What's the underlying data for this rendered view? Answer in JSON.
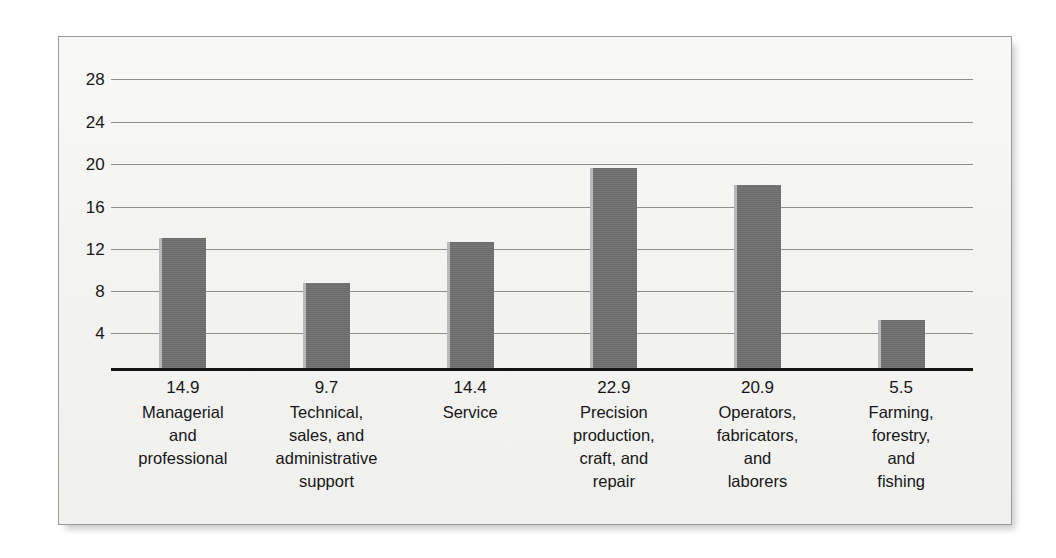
{
  "chart_data": {
    "type": "bar",
    "title": "",
    "subtitle": "",
    "xlabel": "",
    "ylabel": "",
    "ylim": [
      0,
      30
    ],
    "yticks": [
      28,
      24,
      20,
      16,
      12,
      8,
      4
    ],
    "grid": true,
    "legend": false,
    "legend_position": "none",
    "categories": [
      "Managerial\nand\nprofessional",
      "Technical,\nsales, and\nadministrative\nsupport",
      "Service",
      "Precision\nproduction,\ncraft, and\nrepair",
      "Operators,\nfabricators,\nand\nlaborers",
      "Farming,\nforestry,\nand\nfishing"
    ],
    "values": [
      14.9,
      9.7,
      14.4,
      22.9,
      20.9,
      5.5
    ],
    "value_labels": [
      "14.9",
      "9.7",
      "14.4",
      "22.9",
      "20.9",
      "5.5"
    ],
    "series": [
      {
        "name": "",
        "values": [
          14.9,
          9.7,
          14.4,
          22.9,
          20.9,
          5.5
        ]
      }
    ]
  },
  "colors": {
    "bar_fill": "#6f6f6f",
    "bar_highlight": "#b9b9b9",
    "gridline": "#8d8d8d",
    "axis": "#141414",
    "plot_background": "#f3f3f1",
    "page_background": "#ffffff",
    "frame_border": "#9a9a9a",
    "text": "#161616"
  }
}
